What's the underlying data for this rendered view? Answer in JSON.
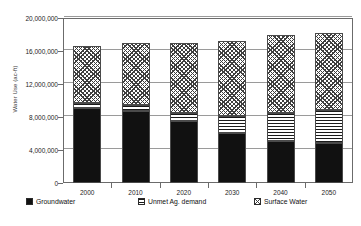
{
  "chart_data": {
    "type": "bar",
    "stacked": true,
    "title": "",
    "xlabel": "",
    "ylabel": "Water Use (ac-ft)",
    "categories": [
      "2000",
      "2010",
      "2020",
      "2030",
      "2040",
      "2050"
    ],
    "ylim": [
      0,
      20000000
    ],
    "yticks": [
      0,
      4000000,
      8000000,
      12000000,
      16000000,
      20000000
    ],
    "ytick_labels": [
      "0",
      "4,000,000",
      "8,000,000",
      "12,000,000",
      "16,000,000",
      "20,000,000"
    ],
    "grid": true,
    "legend_position": "bottom",
    "series": [
      {
        "name": "Groundwater",
        "pattern": "solid-black",
        "values": [
          9100000,
          8700000,
          7500000,
          6100000,
          5100000,
          4800000
        ]
      },
      {
        "name": "Unmet Ag. demand",
        "pattern": "horizontal-lines",
        "values": [
          600000,
          700000,
          1000000,
          2000000,
          3400000,
          4000000
        ]
      },
      {
        "name": "Surface Water",
        "pattern": "cross-hatch",
        "values": [
          6900000,
          7600000,
          8500000,
          9100000,
          9500000,
          9400000
        ]
      }
    ],
    "totals": [
      16600000,
      17000000,
      17000000,
      17200000,
      18000000,
      18200000
    ]
  },
  "legend": {
    "items": [
      {
        "label": "Groundwater",
        "key": "groundwater"
      },
      {
        "label": "Unmet Ag. demand",
        "key": "unmet"
      },
      {
        "label": "Surface Water",
        "key": "surface"
      }
    ]
  },
  "colors": {
    "groundwater": "#111111",
    "axis": "#6b6b6b",
    "grid": "#9a9a9a",
    "text": "#1c1c1c",
    "background": "#ffffff"
  }
}
